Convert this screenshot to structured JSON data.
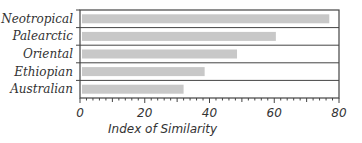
{
  "chart_data": {
    "type": "bar",
    "orientation": "horizontal",
    "title": "",
    "xlabel": "Index of Similarity",
    "ylabel": "",
    "categories": [
      "Neotropical",
      "Palearctic",
      "Oriental",
      "Ethiopian",
      "Australian"
    ],
    "values": [
      77,
      60.5,
      48.5,
      38.5,
      32
    ],
    "xlim": [
      0,
      80
    ],
    "xticks": [
      0,
      20,
      40,
      60,
      80
    ],
    "minor_tick_step": 2,
    "grid": false,
    "legend": null,
    "bar_color": "#c8c8c8"
  }
}
